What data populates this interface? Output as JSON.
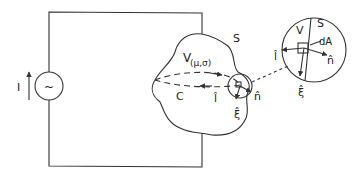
{
  "labels": {
    "current": "I",
    "source_symbol": "~",
    "volume": "V",
    "volume_params": "(μ,σ)",
    "surface": "S",
    "contour": "C",
    "tangent_l": "l̂",
    "normal_n": "n̂",
    "xi": "ξ̂",
    "inset_volume": "V",
    "inset_surface": "S",
    "area_element": "dA",
    "inset_tangent_l": "l̂",
    "inset_normal_n": "n̂",
    "inset_xi": "ξ̂"
  },
  "colors": {
    "line": "#333333",
    "background": "#ffffff"
  }
}
